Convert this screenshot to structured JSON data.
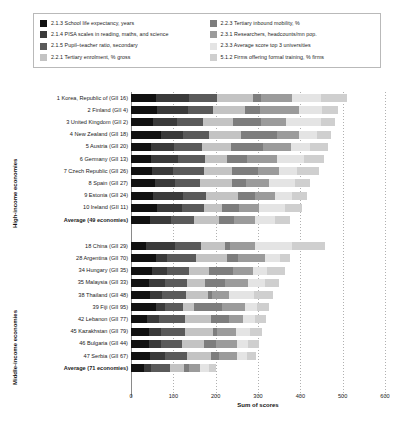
{
  "legend": {
    "items": [
      {
        "label": "2.1.3 School life expectancy, years",
        "color": "#111111",
        "key": "s213"
      },
      {
        "label": "2.2.3 Tertiary inbound mobility, %",
        "color": "#7d7d7d",
        "key": "s223"
      },
      {
        "label": "2.1.4 PISA scales in reading, maths, and science",
        "color": "#3a3a3a",
        "key": "s214"
      },
      {
        "label": "2.3.1 Researchers, headcounts/mn pop.",
        "color": "#9b9b9b",
        "key": "s231"
      },
      {
        "label": "2.1.5 Pupil–teacher ratio, secondary",
        "color": "#5a5a5a",
        "key": "s215"
      },
      {
        "label": "2.3.3 Average score top 3 universities",
        "color": "#e4e4e4",
        "key": "s233"
      },
      {
        "label": "2.2.1 Tertiary enrolment, % gross",
        "color": "#c3c3c3",
        "key": "s221"
      },
      {
        "label": "5.1.2 Firms offering formal training, % firms",
        "color": "#cfcfcf",
        "key": "s512"
      }
    ]
  },
  "axes": {
    "xlabel": "Sum of scores",
    "xticks": [
      "0",
      "100",
      "200",
      "300",
      "400",
      "500",
      "600"
    ],
    "xlim": [
      0,
      600
    ],
    "group_high": "High-income economies",
    "group_middle": "Middle-income economies"
  },
  "caption": "",
  "chart_data": {
    "type": "bar",
    "title": "",
    "xlabel": "Sum of scores",
    "ylabel": "",
    "xlim": [
      0,
      600
    ],
    "grid": true,
    "legend_position": "top",
    "stacked": true,
    "series_order": [
      "s213",
      "s214",
      "s215",
      "s221",
      "s223",
      "s231",
      "s233",
      "s512"
    ],
    "series": [
      {
        "key": "s213",
        "name": "2.1.3 School life expectancy, years",
        "color": "#111111"
      },
      {
        "key": "s214",
        "name": "2.1.4 PISA scales in reading, maths, and science",
        "color": "#3a3a3a"
      },
      {
        "key": "s215",
        "name": "2.1.5 Pupil–teacher ratio, secondary",
        "color": "#5a5a5a"
      },
      {
        "key": "s221",
        "name": "2.2.1 Tertiary enrolment, % gross",
        "color": "#c3c3c3"
      },
      {
        "key": "s223",
        "name": "2.2.3 Tertiary inbound mobility, %",
        "color": "#7d7d7d"
      },
      {
        "key": "s231",
        "name": "2.3.1 Researchers, headcounts/mn pop.",
        "color": "#9b9b9b"
      },
      {
        "key": "s233",
        "name": "2.3.3 Average score top 3 universities",
        "color": "#e4e4e4"
      },
      {
        "key": "s512",
        "name": "5.1.2 Firms offering formal training, % firms",
        "color": "#cfcfcf"
      }
    ],
    "groups": [
      {
        "name": "High-income economies",
        "rows": [
          {
            "label": "1 Korea, Republic of (GII 16)",
            "bold": false,
            "values": {
              "s213": 58,
              "s214": 78,
              "s215": 66,
              "s221": 86,
              "s223": 20,
              "s231": 72,
              "s233": 70,
              "s512": 60
            },
            "total": 510
          },
          {
            "label": "2 Finland (GII 4)",
            "bold": false,
            "values": {
              "s213": 62,
              "s214": 72,
              "s215": 60,
              "s221": 76,
              "s223": 34,
              "s231": 92,
              "s233": 56,
              "s512": 38
            },
            "total": 490
          },
          {
            "label": "3 United Kingdom (GII 2)",
            "bold": false,
            "values": {
              "s213": 52,
              "s214": 56,
              "s215": 62,
              "s221": 70,
              "s223": 66,
              "s231": 60,
              "s233": 82,
              "s512": 34
            },
            "total": 482
          },
          {
            "label": "4 New Zealand (GII 18)",
            "bold": false,
            "values": {
              "s213": 70,
              "s214": 52,
              "s215": 62,
              "s221": 76,
              "s223": 84,
              "s231": 52,
              "s233": 44,
              "s512": 32
            },
            "total": 472
          },
          {
            "label": "5 Austria (GII 20)",
            "bold": false,
            "values": {
              "s213": 48,
              "s214": 54,
              "s215": 66,
              "s221": 68,
              "s223": 76,
              "s231": 66,
              "s233": 46,
              "s512": 42
            },
            "total": 466
          },
          {
            "label": "6 Germany (GII 13)",
            "bold": false,
            "values": {
              "s213": 48,
              "s214": 62,
              "s215": 64,
              "s221": 52,
              "s223": 48,
              "s231": 72,
              "s233": 64,
              "s512": 46
            },
            "total": 456
          },
          {
            "label": "7 Czech Republic (GII 26)",
            "bold": false,
            "values": {
              "s213": 50,
              "s214": 50,
              "s215": 72,
              "s221": 66,
              "s223": 62,
              "s231": 50,
              "s233": 42,
              "s512": 52
            },
            "total": 444
          },
          {
            "label": "8 Spain (GII 27)",
            "bold": false,
            "values": {
              "s213": 56,
              "s214": 48,
              "s215": 58,
              "s221": 76,
              "s223": 34,
              "s231": 54,
              "s233": 62,
              "s512": 36
            },
            "total": 424
          },
          {
            "label": "9 Estonia (GII 24)",
            "bold": false,
            "values": {
              "s213": 52,
              "s214": 70,
              "s215": 56,
              "s221": 74,
              "s223": 40,
              "s231": 48,
              "s233": 40,
              "s512": 36
            },
            "total": 416
          },
          {
            "label": "10 Ireland (GII 11)",
            "bold": false,
            "values": {
              "s213": 62,
              "s214": 58,
              "s215": 52,
              "s221": 44,
              "s223": 40,
              "s231": 46,
              "s233": 62,
              "s512": 40
            },
            "total": 404
          },
          {
            "label": "Average (49 economies)",
            "bold": true,
            "values": {
              "s213": 44,
              "s214": 50,
              "s215": 56,
              "s221": 58,
              "s223": 36,
              "s231": 50,
              "s233": 46,
              "s512": 36
            },
            "total": 376
          }
        ]
      },
      {
        "name": "Middle-income economies",
        "rows": [
          {
            "label": "18 China (GII 29)",
            "bold": false,
            "values": {
              "s213": 36,
              "s214": 68,
              "s215": 62,
              "s221": 56,
              "s223": 12,
              "s231": 58,
              "s233": 88,
              "s512": 78
            },
            "total": 458
          },
          {
            "label": "28 Argentina (GII 70)",
            "bold": false,
            "values": {
              "s213": 58,
              "s214": 26,
              "s215": 70,
              "s221": 74,
              "s223": 26,
              "s231": 62,
              "s233": 36,
              "s512": 24
            },
            "total": 376
          },
          {
            "label": "34 Hungary (GII 35)",
            "bold": false,
            "values": {
              "s213": 50,
              "s214": 34,
              "s215": 54,
              "s221": 46,
              "s223": 56,
              "s231": 48,
              "s233": 34,
              "s512": 42
            },
            "total": 364
          },
          {
            "label": "35 Malaysia (GII 33)",
            "bold": false,
            "values": {
              "s213": 42,
              "s214": 38,
              "s215": 52,
              "s221": 42,
              "s223": 48,
              "s231": 54,
              "s233": 40,
              "s512": 34
            },
            "total": 350
          },
          {
            "label": "38 Thailand (GII 48)",
            "bold": false,
            "values": {
              "s213": 44,
              "s214": 30,
              "s215": 56,
              "s221": 52,
              "s223": 10,
              "s231": 40,
              "s233": 58,
              "s512": 46
            },
            "total": 336
          },
          {
            "label": "39 Fiji (GII 95)",
            "bold": false,
            "values": {
              "s213": 58,
              "s214": 22,
              "s215": 44,
              "s221": 26,
              "s223": 66,
              "s231": 54,
              "s233": 28,
              "s512": 28
            },
            "total": 326
          },
          {
            "label": "42 Lebanon (GII 77)",
            "bold": false,
            "values": {
              "s213": 38,
              "s214": 28,
              "s215": 62,
              "s221": 60,
              "s223": 44,
              "s231": 32,
              "s233": 30,
              "s512": 24
            },
            "total": 318
          },
          {
            "label": "45 Kazakhstan (GII 79)",
            "bold": false,
            "values": {
              "s213": 42,
              "s214": 30,
              "s215": 56,
              "s221": 66,
              "s223": 10,
              "s231": 44,
              "s233": 34,
              "s512": 28
            },
            "total": 310
          },
          {
            "label": "46 Bulgaria (GII 44)",
            "bold": false,
            "values": {
              "s213": 42,
              "s214": 28,
              "s215": 50,
              "s221": 52,
              "s223": 30,
              "s231": 48,
              "s233": 26,
              "s512": 26
            },
            "total": 302
          },
          {
            "label": "47 Serbia (GII 67)",
            "bold": false,
            "values": {
              "s213": 46,
              "s214": 34,
              "s215": 52,
              "s221": 56,
              "s223": 20,
              "s231": 42,
              "s233": 24,
              "s512": 22
            },
            "total": 296
          },
          {
            "label": "Average (71 economies)",
            "bold": true,
            "values": {
              "s213": 30,
              "s214": 18,
              "s215": 44,
              "s221": 34,
              "s223": 12,
              "s231": 24,
              "s233": 22,
              "s512": 18
            },
            "total": 202
          }
        ]
      }
    ]
  }
}
